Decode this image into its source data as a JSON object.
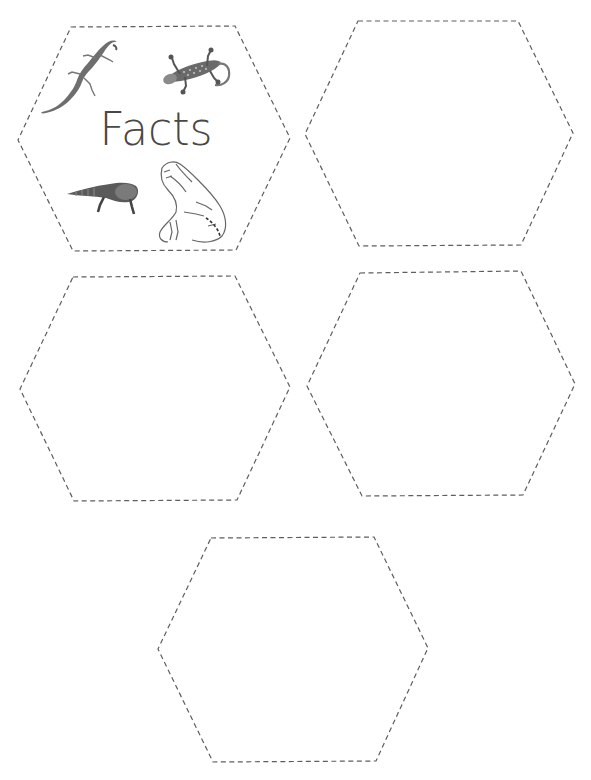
{
  "page": {
    "background": "#ffffff",
    "cut_line_color": "#5e5e5e"
  },
  "cards": [
    {
      "id": "hex-1",
      "title": "Facts",
      "illustrations": [
        "lizard-anole",
        "lizard-gecko",
        "lizard-gila-monster",
        "lizard-iguana"
      ],
      "points": "71,27 235,26 290,138 236,250 73,251 18,140"
    },
    {
      "id": "hex-2",
      "title": "",
      "points": "358,21 518,21 573,133 521,245 359,246 305,134"
    },
    {
      "id": "hex-3",
      "title": "",
      "points": "73,277 235,276 290,387 237,500 74,501 20,389"
    },
    {
      "id": "hex-4",
      "title": "",
      "points": "360,273 521,271 575,384 523,495 362,496 307,386"
    },
    {
      "id": "hex-5",
      "title": "",
      "points": "211,538 374,537 428,648 376,761 213,762 158,649"
    }
  ]
}
